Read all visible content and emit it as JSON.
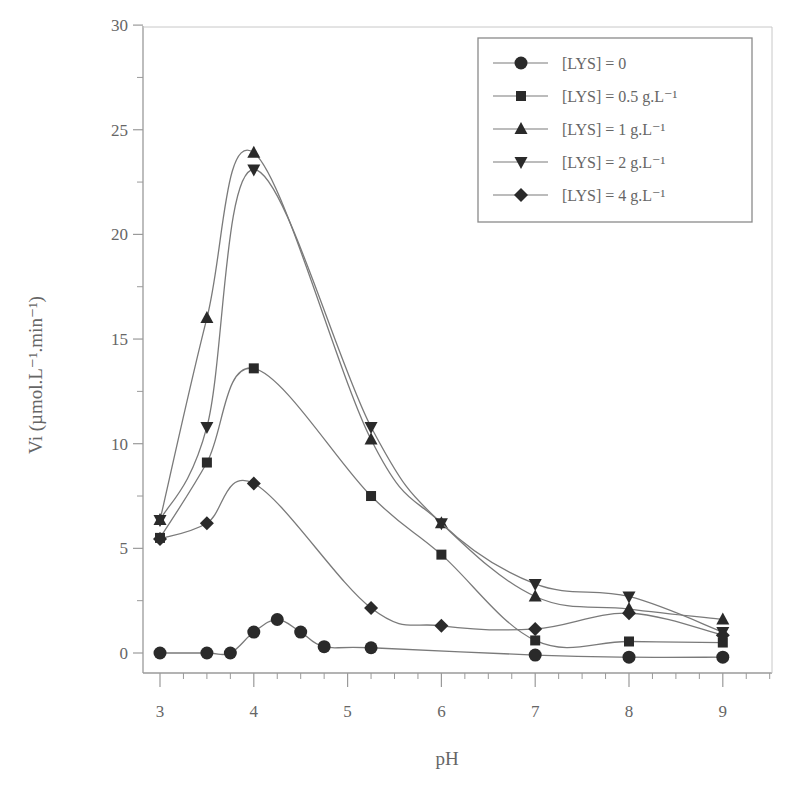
{
  "chart_data": {
    "type": "line",
    "title": "",
    "xlabel": "pH",
    "ylabel": "Vi (µmol.L⁻¹.min⁻¹)",
    "xlim": [
      3,
      9
    ],
    "ylim": [
      0,
      30
    ],
    "xticks": [
      3,
      4,
      5,
      6,
      7,
      8,
      9
    ],
    "yticks": [
      0,
      5,
      10,
      15,
      20,
      25,
      30
    ],
    "grid": false,
    "legend_position": "upper right",
    "series": [
      {
        "name": "[LYS] = 0",
        "marker": "circle",
        "x": [
          3,
          3.5,
          3.75,
          4,
          4.25,
          4.5,
          4.75,
          5.25,
          7,
          8,
          9
        ],
        "y": [
          0,
          0,
          0,
          1.0,
          1.6,
          1.0,
          0.3,
          0.25,
          -0.1,
          -0.2,
          -0.2
        ]
      },
      {
        "name": "[LYS] = 0.5 g.L⁻¹",
        "marker": "square",
        "x": [
          3,
          3.5,
          4,
          5.25,
          6,
          7,
          8,
          9
        ],
        "y": [
          5.5,
          9.1,
          13.6,
          7.5,
          4.7,
          0.6,
          0.55,
          0.5
        ]
      },
      {
        "name": "[LYS] = 1 g.L⁻¹",
        "marker": "triangle-up",
        "x": [
          3,
          3.5,
          4,
          5.25,
          6,
          7,
          8,
          9
        ],
        "y": [
          6.35,
          16.0,
          23.9,
          10.2,
          6.2,
          2.7,
          2.1,
          1.6
        ]
      },
      {
        "name": "[LYS] = 2 g.L⁻¹",
        "marker": "triangle-down",
        "x": [
          3,
          3.5,
          4,
          5.25,
          6,
          7,
          8,
          9
        ],
        "y": [
          6.35,
          10.8,
          23.1,
          10.8,
          6.2,
          3.3,
          2.7,
          1.0
        ]
      },
      {
        "name": "[LYS] = 4 g.L⁻¹",
        "marker": "diamond",
        "x": [
          3,
          3.5,
          4,
          5.25,
          6,
          7,
          8,
          9
        ],
        "y": [
          5.45,
          6.2,
          8.1,
          2.15,
          1.3,
          1.15,
          1.9,
          0.85
        ]
      }
    ]
  },
  "axes": {
    "x_title": "pH",
    "y_title": "Vi (µmol.L⁻¹.min⁻¹)"
  },
  "colors": {
    "line": "#7a7a7a",
    "marker": "#2a2a2a",
    "frame": "#9a9a9a",
    "text": "#666666"
  }
}
